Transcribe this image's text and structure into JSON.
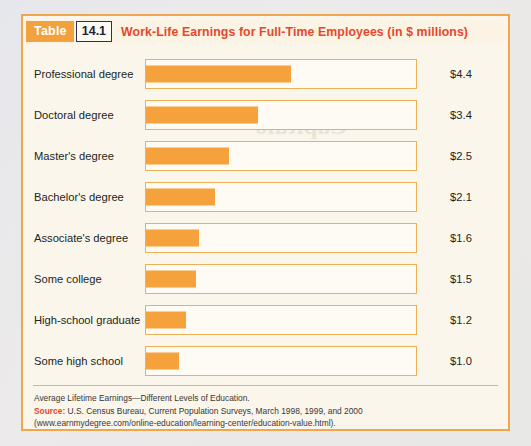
{
  "figure": {
    "table_tag": "Table",
    "table_number": "14.1",
    "title": "Work-Life Earnings for Full-Time Employees (in $ millions)",
    "accent_orange": "#f5a23c",
    "title_red": "#e8472b",
    "paper_cream": "#faf6ec"
  },
  "chart_data": {
    "type": "bar",
    "title": "Work-Life Earnings for Full-Time Employees (in $ millions)",
    "xlabel": "",
    "ylabel": "",
    "orientation": "horizontal",
    "grid": false,
    "legend": null,
    "xlim": [
      0,
      5
    ],
    "categories": [
      "Professional degree",
      "Doctoral degree",
      "Master's degree",
      "Bachelor's degree",
      "Associate's degree",
      "Some college",
      "High-school graduate",
      "Some high school"
    ],
    "values": [
      4.4,
      3.4,
      2.5,
      2.1,
      1.6,
      1.5,
      1.2,
      1.0
    ],
    "value_labels": [
      "$4.4",
      "$3.4",
      "$2.5",
      "$2.1",
      "$1.6",
      "$1.5",
      "$1.2",
      "$1.0"
    ],
    "unit": "$ millions"
  },
  "footer": {
    "line1": "Average Lifetime Earnings—Different Levels of Education.",
    "source_label": "Source:",
    "source_text": "U.S. Census Bureau, Current Population Surveys, March 1998, 1999, and 2000",
    "line3": "(www.earnmydegree.com/online-education/learning-center/education-value.html)."
  },
  "bleed_through": {
    "t1": "Capitulo",
    "t2": "8008",
    "t3": "esercizio",
    "t4": "numerico"
  }
}
